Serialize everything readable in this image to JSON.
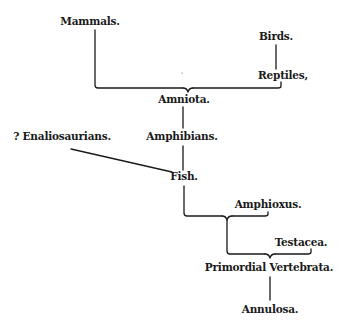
{
  "diagram": {
    "type": "evolutionary-tree",
    "nodes": {
      "mammals": "Mammals.",
      "birds": "Birds.",
      "reptiles": "Reptiles,",
      "amniota": "Amniota.",
      "enaliosaurians": "? Enaliosaurians.",
      "amphibians": "Amphibians.",
      "fish": "Fish.",
      "amphioxus": "Amphioxus.",
      "testacea": "Testacea.",
      "primordial_vertebrata": "Primordial Vertebrata.",
      "annulosa": "Annulosa."
    },
    "edges": [
      [
        "Mammals.",
        "Amniota."
      ],
      [
        "Birds.",
        "Reptiles,"
      ],
      [
        "Reptiles,",
        "Amniota."
      ],
      [
        "Amniota.",
        "Amphibians."
      ],
      [
        "Amphibians.",
        "Fish."
      ],
      [
        "? Enaliosaurians.",
        "Fish."
      ],
      [
        "Fish.",
        "Primordial Vertebrata."
      ],
      [
        "Amphioxus.",
        "Primordial Vertebrata."
      ],
      [
        "Testacea.",
        "Primordial Vertebrata."
      ],
      [
        "Primordial Vertebrata.",
        "Annulosa."
      ]
    ],
    "colors": {
      "ink": "#1a1a1a",
      "background": "#ffffff"
    }
  }
}
